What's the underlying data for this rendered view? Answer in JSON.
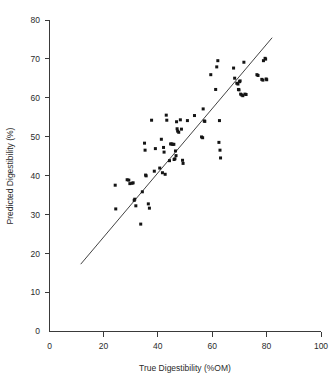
{
  "chart_data": {
    "type": "scatter",
    "title": "",
    "xlabel": "True Digestibility (%OM)",
    "ylabel": "Predicted Digestibility (%)",
    "xlim": [
      0,
      100
    ],
    "ylim": [
      0,
      80
    ],
    "xticks": [
      0,
      20,
      40,
      60,
      80,
      100
    ],
    "yticks": [
      0,
      10,
      20,
      30,
      40,
      50,
      60,
      70,
      80
    ],
    "xtick_labels": [
      "0",
      "20",
      "40",
      "60",
      "80",
      "100"
    ],
    "ytick_labels": [
      "0",
      "10",
      "20",
      "30",
      "40",
      "50",
      "60",
      "70",
      "80"
    ],
    "grid": false,
    "legend": "none",
    "marker": "square",
    "marker_color": "#141414",
    "marker_size_px": 3,
    "series": [
      {
        "name": "Digestibility observations",
        "points": [
          [
            24.2,
            37.6
          ],
          [
            24.4,
            31.5
          ],
          [
            28.6,
            39.0
          ],
          [
            29.2,
            38.9
          ],
          [
            29.6,
            38.0
          ],
          [
            30.4,
            38.1
          ],
          [
            30.8,
            38.2
          ],
          [
            31.2,
            33.7
          ],
          [
            31.4,
            34.0
          ],
          [
            31.8,
            32.3
          ],
          [
            33.6,
            27.6
          ],
          [
            34.2,
            35.9
          ],
          [
            35.0,
            48.4
          ],
          [
            35.2,
            46.6
          ],
          [
            35.4,
            40.2
          ],
          [
            35.6,
            40.0
          ],
          [
            36.4,
            32.8
          ],
          [
            36.8,
            31.7
          ],
          [
            37.6,
            54.3
          ],
          [
            38.6,
            41.2
          ],
          [
            39.0,
            47.0
          ],
          [
            40.6,
            42.0
          ],
          [
            41.2,
            49.4
          ],
          [
            41.6,
            40.8
          ],
          [
            42.0,
            47.3
          ],
          [
            42.2,
            46.1
          ],
          [
            42.6,
            40.4
          ],
          [
            43.0,
            55.6
          ],
          [
            43.2,
            54.3
          ],
          [
            44.2,
            43.9
          ],
          [
            44.6,
            48.2
          ],
          [
            45.0,
            48.2
          ],
          [
            45.4,
            48.1
          ],
          [
            45.8,
            48.1
          ],
          [
            45.9,
            44.2
          ],
          [
            46.2,
            44.4
          ],
          [
            46.4,
            46.4
          ],
          [
            46.6,
            45.2
          ],
          [
            46.8,
            53.9
          ],
          [
            47.0,
            52.1
          ],
          [
            47.2,
            51.5
          ],
          [
            47.6,
            51.2
          ],
          [
            48.2,
            54.4
          ],
          [
            48.6,
            52.0
          ],
          [
            49.0,
            44.0
          ],
          [
            49.2,
            43.2
          ],
          [
            50.8,
            54.2
          ],
          [
            53.4,
            55.5
          ],
          [
            56.0,
            50.0
          ],
          [
            56.4,
            49.8
          ],
          [
            56.6,
            57.2
          ],
          [
            57.0,
            54.1
          ],
          [
            57.2,
            54.0
          ],
          [
            59.4,
            66.0
          ],
          [
            61.2,
            62.2
          ],
          [
            61.6,
            68.0
          ],
          [
            62.0,
            69.6
          ],
          [
            62.4,
            48.6
          ],
          [
            62.6,
            54.2
          ],
          [
            62.8,
            46.6
          ],
          [
            63.0,
            44.6
          ],
          [
            67.8,
            67.7
          ],
          [
            68.2,
            65.1
          ],
          [
            69.0,
            63.8
          ],
          [
            69.4,
            63.6
          ],
          [
            69.6,
            62.2
          ],
          [
            69.8,
            62.1
          ],
          [
            70.0,
            64.2
          ],
          [
            70.2,
            64.4
          ],
          [
            70.4,
            61.0
          ],
          [
            70.8,
            60.8
          ],
          [
            71.2,
            60.6
          ],
          [
            71.6,
            69.2
          ],
          [
            72.0,
            61.0
          ],
          [
            72.4,
            60.9
          ],
          [
            76.4,
            66.0
          ],
          [
            76.8,
            65.8
          ],
          [
            78.2,
            64.8
          ],
          [
            78.6,
            64.6
          ],
          [
            78.8,
            69.6
          ],
          [
            79.4,
            70.2
          ],
          [
            79.6,
            70.0
          ],
          [
            79.8,
            64.9
          ],
          [
            80.0,
            64.7
          ]
        ]
      }
    ],
    "fit_line": {
      "name": "regression line",
      "x_start": 11.5,
      "y_start": 17.3,
      "x_end": 82.0,
      "y_end": 75.5
    }
  }
}
